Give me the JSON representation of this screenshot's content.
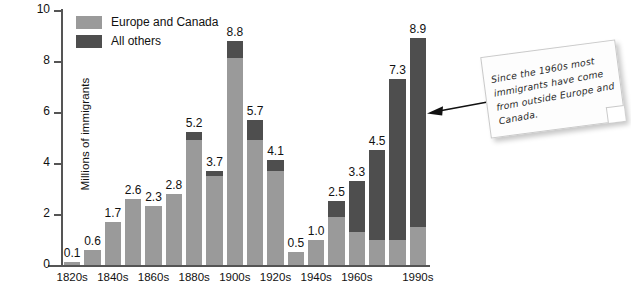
{
  "chart_data": {
    "type": "bar",
    "title": "",
    "subtitle": "",
    "xlabel": "",
    "ylabel": "Millions of immigrants",
    "ylim": [
      0,
      10
    ],
    "yticks": [
      0,
      2,
      4,
      6,
      8,
      10
    ],
    "grid": false,
    "stacked": true,
    "legend_position": "top-left",
    "categories": [
      "1820s",
      "1830s",
      "1840s",
      "1850s",
      "1860s",
      "1870s",
      "1880s",
      "1890s",
      "1900s",
      "1910s",
      "1920s",
      "1930s",
      "1940s",
      "1950s",
      "1960s",
      "1970s",
      "1980s",
      "1990s"
    ],
    "visible_tick_labels": [
      "1820s",
      "1840s",
      "1860s",
      "1880s",
      "1900s",
      "1920s",
      "1940s",
      "1960s",
      "1990s"
    ],
    "totals": [
      0.1,
      0.6,
      1.7,
      2.6,
      2.3,
      2.8,
      5.2,
      3.7,
      8.8,
      5.7,
      4.1,
      0.5,
      1.0,
      2.5,
      3.3,
      4.5,
      7.3,
      8.9
    ],
    "series": [
      {
        "name": "Europe and Canada",
        "color": "#9a9a9a",
        "values": [
          0.1,
          0.6,
          1.7,
          2.6,
          2.3,
          2.8,
          4.9,
          3.5,
          8.1,
          4.9,
          3.7,
          0.5,
          1.0,
          1.9,
          1.3,
          1.0,
          1.0,
          1.5
        ]
      },
      {
        "name": "All others",
        "color": "#4e4e4e",
        "values": [
          0.0,
          0.0,
          0.0,
          0.0,
          0.0,
          0.0,
          0.3,
          0.2,
          0.7,
          0.8,
          0.4,
          0.0,
          0.0,
          0.6,
          2.0,
          3.5,
          6.3,
          7.4
        ]
      }
    ],
    "bar_labels": [
      "0.1",
      "0.6",
      "1.7",
      "2.6",
      "2.3",
      "2.8",
      "5.2",
      "3.7",
      "8.8",
      "5.7",
      "4.1",
      "0.5",
      "1.0",
      "2.5",
      "3.3",
      "4.5",
      "7.3",
      "8.9"
    ],
    "annotation": {
      "text": "Since the 1960s most immigrants have come from outside Europe and Canada.",
      "points_to": "1990s",
      "style": "sticky-note-with-arrow"
    }
  },
  "legend": {
    "items": [
      {
        "label": "Europe and Canada",
        "color": "#9a9a9a"
      },
      {
        "label": "All others",
        "color": "#4e4e4e"
      }
    ]
  },
  "axes": {
    "y_title": "Millions of immigrants",
    "y_tick_labels": [
      "0",
      "2",
      "4",
      "6",
      "8",
      "10"
    ]
  },
  "colors": {
    "europe": "#9a9a9a",
    "all_others": "#4e4e4e",
    "axis": "#555555",
    "text": "#111111",
    "note_bg": "#fdfdfd",
    "note_border": "#c9c9c9",
    "background": "#ffffff"
  }
}
